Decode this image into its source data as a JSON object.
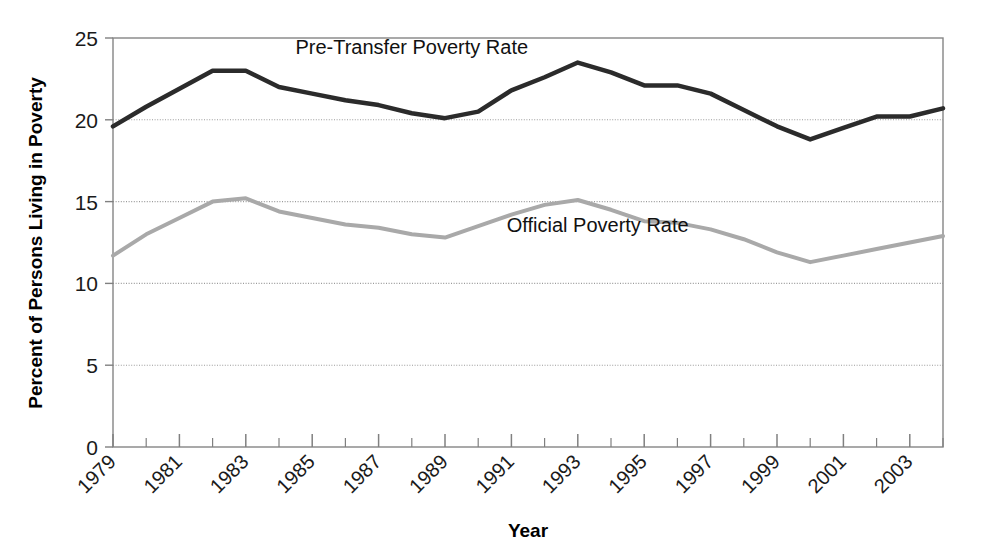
{
  "chart_data": {
    "type": "line",
    "title": "",
    "xlabel": "Year",
    "ylabel": "Percent of Persons Living in Poverty",
    "xlim": [
      1979,
      2004
    ],
    "ylim": [
      0,
      25
    ],
    "ytick_values": [
      0,
      5,
      10,
      15,
      20,
      25
    ],
    "ytick_labels": [
      "0",
      "5",
      "10",
      "15",
      "20",
      "25"
    ],
    "xtick_values": [
      1979,
      1981,
      1983,
      1985,
      1987,
      1989,
      1991,
      1993,
      1995,
      1997,
      1999,
      2001,
      2003
    ],
    "xtick_labels": [
      "1979",
      "1981",
      "1983",
      "1985",
      "1987",
      "1989",
      "1991",
      "1993",
      "1995",
      "1997",
      "1999",
      "2001",
      "2003"
    ],
    "xtick_rotation": 45,
    "minor_xticks_every": 1,
    "grid": "horizontal-major-dotted",
    "legend_position": "inline-annotations",
    "x": [
      1979,
      1980,
      1981,
      1982,
      1983,
      1984,
      1985,
      1986,
      1987,
      1988,
      1989,
      1990,
      1991,
      1992,
      1993,
      1994,
      1995,
      1996,
      1997,
      1998,
      1999,
      2000,
      2001,
      2002,
      2003,
      2004
    ],
    "series": [
      {
        "name": "Pre-Transfer Poverty Rate",
        "color": "#2b2b2b",
        "linewidth": 4.5,
        "label_x": 1988.0,
        "label_y": 24.05,
        "values": [
          19.6,
          20.8,
          21.9,
          23.0,
          23.0,
          22.0,
          21.6,
          21.2,
          20.9,
          20.4,
          20.1,
          20.5,
          21.8,
          22.6,
          23.5,
          22.9,
          22.1,
          22.1,
          21.6,
          20.6,
          19.6,
          18.8,
          19.5,
          20.2,
          20.2,
          20.7
        ]
      },
      {
        "name": "Official Poverty Rate",
        "color": "#a9a9a9",
        "linewidth": 4.0,
        "label_x": 1993.6,
        "label_y": 13.15,
        "values": [
          11.7,
          13.0,
          14.0,
          15.0,
          15.2,
          14.4,
          14.0,
          13.6,
          13.4,
          13.0,
          12.8,
          13.5,
          14.2,
          14.8,
          15.1,
          14.5,
          13.8,
          13.7,
          13.3,
          12.7,
          11.9,
          11.3,
          11.7,
          12.1,
          12.5,
          12.9
        ]
      }
    ]
  },
  "axes": {
    "frame_color": "#808080",
    "grid_color": "#9a9a9a",
    "tick_color": "#808080"
  }
}
